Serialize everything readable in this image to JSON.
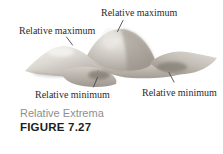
{
  "figure": {
    "annotations": [
      {
        "id": "top-maximum",
        "label": "Relative maximum"
      },
      {
        "id": "left-maximum",
        "label": "Relative maximum"
      },
      {
        "id": "left-minimum",
        "label": "Relative minimum"
      },
      {
        "id": "right-minimum",
        "label": "Relative minimum"
      }
    ],
    "caption": "Relative Extrema",
    "figure_label": "FIGURE 7.27",
    "colors": {
      "label_text": "#2b2b2b",
      "caption_text": "#8f8f8f",
      "figure_label_text": "#1d1d1d",
      "leader_line": "#4a4a4a",
      "surface_highlight": "#f6f4f1",
      "surface_mid": "#c7c2bb",
      "surface_shadow": "#938d84",
      "background": "#ffffff"
    }
  }
}
